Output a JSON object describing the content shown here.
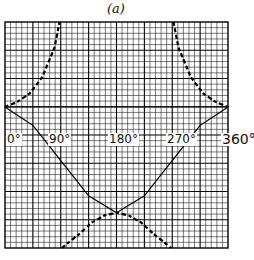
{
  "chart_data": {
    "type": "line",
    "title": "(a)",
    "xlabel": "",
    "ylabel": "",
    "x_ticks": [
      "0°",
      "90°",
      "180°",
      "270°",
      "360°"
    ],
    "xlim": [
      0,
      360
    ],
    "ylim": [
      -1,
      1
    ],
    "grid": true,
    "legend": null,
    "series": [
      {
        "name": "solid curve",
        "style": "solid",
        "x": [
          0,
          45,
          90,
          135,
          180,
          225,
          270,
          315,
          360
        ],
        "y": [
          0,
          -0.13,
          -0.38,
          -0.63,
          -0.75,
          -0.63,
          -0.38,
          -0.13,
          0
        ]
      },
      {
        "name": "dashed curve (upper branches)",
        "style": "dashed",
        "x": [
          0,
          20,
          40,
          60,
          80,
          88,
          272,
          280,
          300,
          320,
          340,
          360
        ],
        "y": [
          0,
          0.06,
          0.16,
          0.35,
          0.7,
          1.0,
          1.0,
          0.7,
          0.35,
          0.16,
          0.06,
          0
        ]
      },
      {
        "name": "dashed curve (lower branch)",
        "style": "dashed",
        "x": [
          92,
          100,
          120,
          140,
          160,
          180,
          200,
          220,
          240,
          260,
          268
        ],
        "y": [
          -1.0,
          -0.97,
          -0.9,
          -0.82,
          -0.77,
          -0.75,
          -0.77,
          -0.82,
          -0.9,
          -0.97,
          -1.0
        ]
      }
    ]
  }
}
